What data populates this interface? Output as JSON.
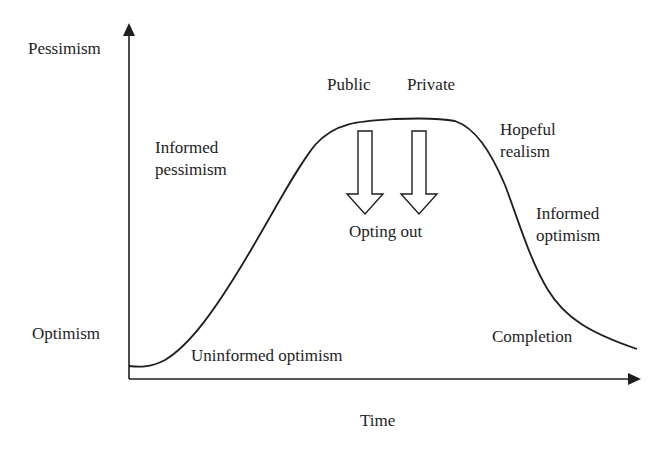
{
  "diagram": {
    "axes": {
      "y_top_label": "Pessimism",
      "y_bottom_label": "Optimism",
      "x_label": "Time"
    },
    "stages": [
      {
        "id": "uninformed-optimism",
        "lines": [
          "Uninformed optimism"
        ]
      },
      {
        "id": "informed-pessimism",
        "lines": [
          "Informed",
          "pessimism"
        ]
      },
      {
        "id": "hopeful-realism",
        "lines": [
          "Hopeful",
          "realism"
        ]
      },
      {
        "id": "informed-optimism",
        "lines": [
          "Informed",
          "optimism"
        ]
      },
      {
        "id": "completion",
        "lines": [
          "Completion"
        ]
      }
    ],
    "checkout_points": {
      "public_label": "Public",
      "private_label": "Private",
      "arrows_label": "Opting out"
    },
    "colors": {
      "line": "#1e1e1e",
      "background": "#ffffff"
    }
  }
}
